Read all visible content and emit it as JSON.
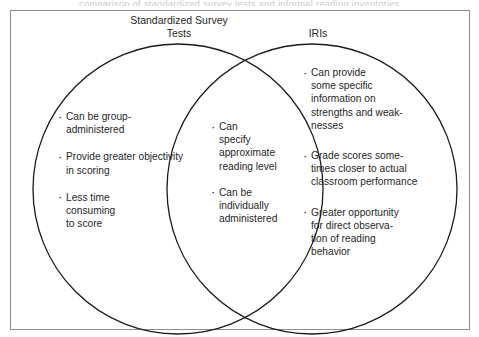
{
  "page": {
    "caption_bleed": "comparison of standardized survey tests and informal reading inventories"
  },
  "diagram": {
    "type": "venn",
    "frame": {
      "stroke_color": "#8d8d8d"
    },
    "circles": [
      {
        "id": "left",
        "heading": "Standardized Survey\nTests",
        "center_x": 178,
        "center_y": 189,
        "radius": 145,
        "stroke_color": "#1a1a1a"
      },
      {
        "id": "right",
        "heading": "IRIs",
        "center_x": 312,
        "center_y": 189,
        "radius": 145,
        "stroke_color": "#1a1a1a"
      }
    ],
    "regions": {
      "left_only": {
        "label": "Standardized Survey Tests",
        "bullets": [
          "Can be group-\nadministered",
          "Provide greater objectivity\nin scoring",
          "Less time\nconsuming\nto score"
        ]
      },
      "intersection": {
        "label": "Shared",
        "bullets": [
          "Can\nspecify\napproximate\nreading level",
          "Can be\nindividually\nadministered"
        ]
      },
      "right_only": {
        "label": "IRIs",
        "bullets": [
          "Can provide\nsome specific\ninformation on\nstrengths and weak-\nnesses",
          "Grade scores some-\ntimes closer to actual\nclassroom performance",
          "Greater opportunity\nfor direct observa-\ntion of reading\nbehavior"
        ]
      }
    }
  }
}
